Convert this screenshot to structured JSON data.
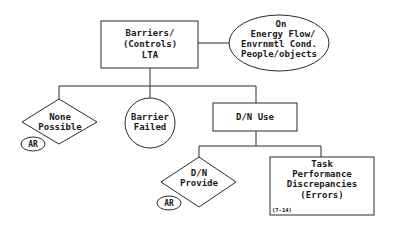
{
  "diagram": {
    "type": "fault-tree",
    "nodes": {
      "barriers": {
        "lines": [
          "Barriers/",
          "(Controls)",
          "LTA"
        ],
        "shape": "rectangle"
      },
      "on_condition": {
        "lines": [
          "On",
          "Energy Flow/",
          "Envrnmtl Cond.",
          "People/objects"
        ],
        "shape": "ellipse"
      },
      "none_possible": {
        "lines": [
          "None",
          "Possible"
        ],
        "shape": "diamond",
        "tag": "AR"
      },
      "barrier_failed": {
        "lines": [
          "Barrier",
          "Failed"
        ],
        "shape": "circle"
      },
      "dn_use": {
        "lines": [
          "D/N Use"
        ],
        "shape": "rectangle"
      },
      "dn_provide": {
        "lines": [
          "D/N",
          "Provide"
        ],
        "shape": "diamond",
        "tag": "AR"
      },
      "task_perf": {
        "lines": [
          "Task",
          "Performance",
          "Discrepancies",
          "(Errors)"
        ],
        "shape": "rectangle",
        "ref": "(7-14)"
      }
    },
    "edges": [
      [
        "barriers",
        "on_condition"
      ],
      [
        "barriers",
        "none_possible"
      ],
      [
        "barriers",
        "barrier_failed"
      ],
      [
        "barriers",
        "dn_use"
      ],
      [
        "dn_use",
        "dn_provide"
      ],
      [
        "dn_use",
        "task_perf"
      ]
    ]
  }
}
